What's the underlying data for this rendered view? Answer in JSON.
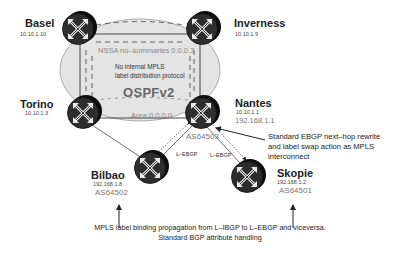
{
  "diagram": {
    "routers": [
      {
        "id": "basel",
        "name": "Basel",
        "ip": "10.10.1.10"
      },
      {
        "id": "inverness",
        "name": "Inverness",
        "ip": "10.10.1.9"
      },
      {
        "id": "torino",
        "name": "Torino",
        "ip": "10.10.1.3"
      },
      {
        "id": "nantes",
        "name": "Nantes",
        "ip": "10.10.1.1",
        "ip2": "192.168.1.1",
        "as": "AS64503"
      },
      {
        "id": "bilbao",
        "name": "Bilbao",
        "ip": "192.168.1.8",
        "as": "AS64502"
      },
      {
        "id": "skopie",
        "name": "Skopie",
        "ip": "192.168.1.2",
        "as": "AS64501"
      }
    ],
    "areas": {
      "nssa": "NSSA no–summaries 0.0.0.3",
      "backbone": "Area 0.0.0.0"
    },
    "igp": {
      "note_line1": "No internal MPLS",
      "note_line2": "label distribution protocol",
      "protocol": "OSPFv2"
    },
    "links": {
      "nantes_bilbao": "L–EBGP",
      "nantes_skopie": "L–EBGP"
    },
    "annotations": {
      "nantes": [
        "Standard EBGP next–hop rewrite",
        "and label swap action as MPLS",
        "interconnect"
      ],
      "bottom": [
        "MPLS label binding propagation from L–IBGP to L–EBGP and viceversa.",
        "Standard BGP attribute handling"
      ]
    },
    "colors": {
      "router_body": "#2b2b2b",
      "router_side": "#111111",
      "area_fill": "#e4e4e4",
      "line": "#333333"
    }
  }
}
